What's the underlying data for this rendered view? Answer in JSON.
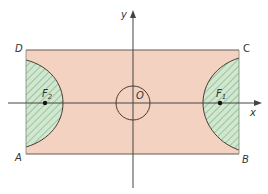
{
  "diagram": {
    "colors": {
      "rectangle_fill": "#f3d2c2",
      "rectangle_stroke": "#6b5a52",
      "region_fill": "#cfe8cf",
      "hatch": "#7fa97f",
      "axis": "#444444",
      "curve": "#4a3a34",
      "point": "#111111"
    },
    "axes": {
      "x_label": "x",
      "y_label": "y"
    },
    "origin_label": "O",
    "vertices": {
      "A": "A",
      "B": "B",
      "C": "C",
      "D": "D"
    },
    "foci": {
      "f1": {
        "letter": "F",
        "sub": "1"
      },
      "f2": {
        "letter": "F",
        "sub": "2"
      }
    }
  }
}
